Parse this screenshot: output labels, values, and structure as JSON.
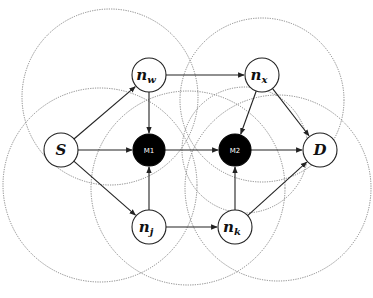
{
  "diagram": {
    "type": "network-graph",
    "regions": [
      {
        "id": "r1",
        "cx": 110,
        "cy": 97,
        "r": 88
      },
      {
        "id": "r2",
        "cx": 262,
        "cy": 100,
        "r": 82
      },
      {
        "id": "r3",
        "cx": 100,
        "cy": 185,
        "r": 97
      },
      {
        "id": "r4",
        "cx": 188,
        "cy": 188,
        "r": 97
      },
      {
        "id": "r5",
        "cx": 278,
        "cy": 188,
        "r": 93
      },
      {
        "id": "r6",
        "cx": 245,
        "cy": 150,
        "r": 63
      }
    ],
    "nodes": [
      {
        "id": "S",
        "label": "S",
        "sub": "",
        "x": 61,
        "y": 150,
        "r": 17,
        "dark": false
      },
      {
        "id": "nw",
        "label": "n",
        "sub": "w",
        "x": 149,
        "y": 75,
        "r": 17,
        "dark": false
      },
      {
        "id": "nx",
        "label": "n",
        "sub": "x",
        "x": 262,
        "y": 75,
        "r": 17,
        "dark": false
      },
      {
        "id": "M1",
        "label": "M1",
        "sub": "",
        "x": 149,
        "y": 150,
        "r": 16,
        "dark": true
      },
      {
        "id": "M2",
        "label": "M2",
        "sub": "",
        "x": 235,
        "y": 150,
        "r": 16,
        "dark": true
      },
      {
        "id": "D",
        "label": "D",
        "sub": "",
        "x": 320,
        "y": 150,
        "r": 17,
        "dark": false
      },
      {
        "id": "nj",
        "label": "n",
        "sub": "j",
        "x": 149,
        "y": 227,
        "r": 17,
        "dark": false
      },
      {
        "id": "nk",
        "label": "n",
        "sub": "k",
        "x": 235,
        "y": 227,
        "r": 17,
        "dark": false
      }
    ],
    "edges": [
      {
        "from": "S",
        "to": "nw"
      },
      {
        "from": "S",
        "to": "M1"
      },
      {
        "from": "S",
        "to": "nj"
      },
      {
        "from": "nw",
        "to": "nx"
      },
      {
        "from": "nw",
        "to": "M1"
      },
      {
        "from": "nj",
        "to": "M1"
      },
      {
        "from": "nj",
        "to": "nk"
      },
      {
        "from": "M1",
        "to": "M2"
      },
      {
        "from": "nx",
        "to": "M2"
      },
      {
        "from": "nk",
        "to": "M2"
      },
      {
        "from": "M2",
        "to": "D"
      },
      {
        "from": "nx",
        "to": "D"
      },
      {
        "from": "nk",
        "to": "D"
      }
    ]
  }
}
